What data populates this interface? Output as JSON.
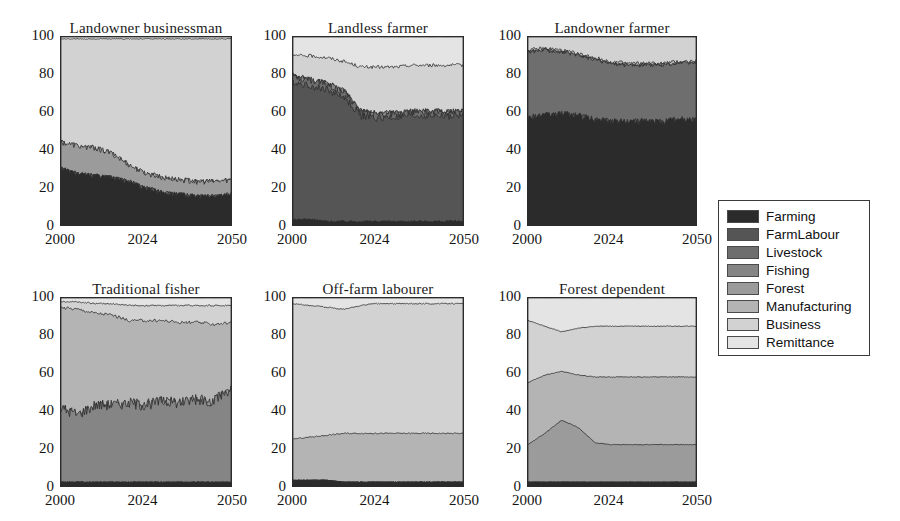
{
  "figure": {
    "width": 900,
    "height": 521,
    "background": "#ffffff"
  },
  "legend": {
    "position": "right",
    "entries": [
      {
        "label": "Farming",
        "color": "#2b2b2b"
      },
      {
        "label": "FarmLabour",
        "color": "#555555"
      },
      {
        "label": "Livestock",
        "color": "#6e6e6e"
      },
      {
        "label": "Fishing",
        "color": "#858585"
      },
      {
        "label": "Forest",
        "color": "#9b9b9b"
      },
      {
        "label": "Manufacturing",
        "color": "#b4b4b4"
      },
      {
        "label": "Business",
        "color": "#d2d2d2"
      },
      {
        "label": "Remittance",
        "color": "#e4e4e4"
      }
    ]
  },
  "axes": {
    "ylabel": "",
    "xlabel": "",
    "yticks": [
      0,
      20,
      40,
      60,
      80,
      100
    ],
    "xticks": [
      2000,
      2024,
      2050
    ],
    "ylim": [
      0,
      100
    ],
    "xlim": [
      2000,
      2050
    ],
    "grid": false
  },
  "chart_data": {
    "type": "area",
    "title": "",
    "stacked": true,
    "normalized": true,
    "xlabel": "",
    "ylabel": "",
    "ylim": [
      0,
      100
    ],
    "xlim": [
      2000,
      2050
    ],
    "grid": false,
    "legend_position": "right",
    "series_names": [
      "Farming",
      "FarmLabour",
      "Livestock",
      "Fishing",
      "Forest",
      "Manufacturing",
      "Business",
      "Remittance"
    ],
    "series_colors": [
      "#2b2b2b",
      "#555555",
      "#6e6e6e",
      "#858585",
      "#9b9b9b",
      "#b4b4b4",
      "#d2d2d2",
      "#e4e4e4"
    ],
    "x": [
      2000,
      2005,
      2010,
      2015,
      2020,
      2024,
      2030,
      2035,
      2040,
      2045,
      2050
    ],
    "panels": [
      {
        "title": "Landowner businessman",
        "cumulative_boundaries": {
          "Farming": [
            30,
            27,
            26,
            25,
            23,
            20,
            17,
            16,
            15,
            15,
            16
          ],
          "FarmLabour": [
            30,
            27,
            26,
            25,
            23,
            20,
            17,
            16,
            15,
            15,
            16
          ],
          "Livestock": [
            30,
            27,
            26,
            25,
            23,
            20,
            17,
            16,
            15,
            15,
            16
          ],
          "Fishing": [
            30,
            27,
            26,
            25,
            23,
            20,
            17,
            16,
            15,
            15,
            16
          ],
          "Forest": [
            44,
            42,
            41,
            38,
            32,
            28,
            25,
            24,
            23,
            23,
            24
          ],
          "Manufacturing": [
            44,
            42,
            41,
            38,
            32,
            28,
            25,
            24,
            23,
            23,
            24
          ],
          "Business": [
            99,
            99,
            99,
            99,
            99,
            99,
            99,
            99,
            99,
            99,
            99
          ],
          "Remittance": [
            100,
            100,
            100,
            100,
            100,
            100,
            100,
            100,
            100,
            100,
            100
          ]
        }
      },
      {
        "title": "Landless farmer",
        "cumulative_boundaries": {
          "Farming": [
            3,
            3,
            2,
            2,
            2,
            2,
            2,
            2,
            2,
            2,
            2
          ],
          "FarmLabour": [
            76,
            74,
            72,
            68,
            58,
            57,
            57,
            58,
            58,
            58,
            58
          ],
          "Livestock": [
            79,
            77,
            75,
            71,
            60,
            59,
            59,
            60,
            60,
            60,
            60
          ],
          "Fishing": [
            79,
            77,
            75,
            71,
            60,
            59,
            59,
            60,
            60,
            60,
            60
          ],
          "Forest": [
            79,
            77,
            75,
            71,
            60,
            59,
            59,
            60,
            60,
            60,
            60
          ],
          "Manufacturing": [
            79,
            77,
            75,
            71,
            60,
            59,
            59,
            60,
            60,
            60,
            60
          ],
          "Business": [
            90,
            90,
            89,
            87,
            84,
            84,
            84,
            85,
            85,
            85,
            85
          ],
          "Remittance": [
            100,
            100,
            100,
            100,
            100,
            100,
            100,
            100,
            100,
            100,
            100
          ]
        }
      },
      {
        "title": "Landowner farmer",
        "cumulative_boundaries": {
          "Farming": [
            57,
            58,
            59,
            58,
            56,
            55,
            55,
            55,
            55,
            56,
            56
          ],
          "FarmLabour": [
            57,
            58,
            59,
            58,
            56,
            55,
            55,
            55,
            55,
            56,
            56
          ],
          "Livestock": [
            92,
            93,
            92,
            90,
            88,
            86,
            85,
            85,
            85,
            86,
            86
          ],
          "Fishing": [
            92,
            93,
            92,
            90,
            88,
            86,
            85,
            85,
            85,
            86,
            86
          ],
          "Forest": [
            92,
            93,
            92,
            90,
            88,
            86,
            85,
            85,
            85,
            86,
            86
          ],
          "Manufacturing": [
            93,
            94,
            93,
            91,
            89,
            87,
            86,
            86,
            86,
            87,
            87
          ],
          "Business": [
            100,
            100,
            100,
            100,
            100,
            100,
            100,
            100,
            100,
            100,
            100
          ],
          "Remittance": [
            100,
            100,
            100,
            100,
            100,
            100,
            100,
            100,
            100,
            100,
            100
          ]
        }
      },
      {
        "title": "Traditional fisher",
        "cumulative_boundaries": {
          "Farming": [
            2,
            2,
            2,
            2,
            2,
            2,
            2,
            2,
            2,
            2,
            2
          ],
          "FarmLabour": [
            2,
            2,
            2,
            2,
            2,
            2,
            2,
            2,
            2,
            2,
            2
          ],
          "Livestock": [
            2,
            2,
            2,
            2,
            2,
            2,
            2,
            2,
            2,
            2,
            2
          ],
          "Fishing": [
            41,
            38,
            43,
            43,
            44,
            43,
            45,
            44,
            46,
            45,
            52
          ],
          "Forest": [
            41,
            38,
            43,
            43,
            44,
            43,
            45,
            44,
            46,
            45,
            52
          ],
          "Manufacturing": [
            95,
            94,
            92,
            91,
            88,
            88,
            88,
            87,
            87,
            86,
            87
          ],
          "Business": [
            98,
            98,
            97,
            97,
            96,
            96,
            96,
            96,
            96,
            96,
            96
          ],
          "Remittance": [
            100,
            100,
            100,
            100,
            100,
            100,
            100,
            100,
            100,
            100,
            100
          ]
        }
      },
      {
        "title": "Off-farm labourer",
        "cumulative_boundaries": {
          "Farming": [
            3,
            3,
            3,
            2,
            2,
            2,
            2,
            2,
            2,
            2,
            2
          ],
          "FarmLabour": [
            3,
            3,
            3,
            2,
            2,
            2,
            2,
            2,
            2,
            2,
            2
          ],
          "Livestock": [
            3,
            3,
            3,
            2,
            2,
            2,
            2,
            2,
            2,
            2,
            2
          ],
          "Fishing": [
            3,
            3,
            3,
            2,
            2,
            2,
            2,
            2,
            2,
            2,
            2
          ],
          "Forest": [
            3,
            3,
            3,
            2,
            2,
            2,
            2,
            2,
            2,
            2,
            2
          ],
          "Manufacturing": [
            25,
            26,
            27,
            28,
            28,
            28,
            28,
            28,
            28,
            28,
            28
          ],
          "Business": [
            97,
            96,
            95,
            94,
            96,
            97,
            97,
            97,
            97,
            97,
            97
          ],
          "Remittance": [
            100,
            100,
            100,
            100,
            100,
            100,
            100,
            100,
            100,
            100,
            100
          ]
        }
      },
      {
        "title": "Forest dependent",
        "cumulative_boundaries": {
          "Farming": [
            2,
            2,
            2,
            2,
            2,
            2,
            2,
            2,
            2,
            2,
            2
          ],
          "FarmLabour": [
            2,
            2,
            2,
            2,
            2,
            2,
            2,
            2,
            2,
            2,
            2
          ],
          "Livestock": [
            2,
            2,
            2,
            2,
            2,
            2,
            2,
            2,
            2,
            2,
            2
          ],
          "Fishing": [
            2,
            2,
            2,
            2,
            2,
            2,
            2,
            2,
            2,
            2,
            2
          ],
          "Forest": [
            22,
            28,
            35,
            31,
            23,
            22,
            22,
            22,
            22,
            22,
            22
          ],
          "Manufacturing": [
            55,
            59,
            61,
            59,
            58,
            58,
            58,
            58,
            58,
            58,
            58
          ],
          "Business": [
            88,
            85,
            82,
            84,
            85,
            85,
            85,
            85,
            85,
            85,
            85
          ],
          "Remittance": [
            100,
            100,
            100,
            100,
            100,
            100,
            100,
            100,
            100,
            100,
            100
          ]
        }
      }
    ]
  },
  "layout": {
    "panels": [
      {
        "box_x": 60,
        "box_y": 36,
        "box_w": 172,
        "box_h": 190,
        "title_x": 35,
        "title_y": 20
      },
      {
        "box_x": 292,
        "box_y": 36,
        "box_w": 172,
        "box_h": 190,
        "title_x": 267,
        "title_y": 20
      },
      {
        "box_x": 527,
        "box_y": 36,
        "box_w": 170,
        "box_h": 190,
        "title_x": 502,
        "title_y": 20
      },
      {
        "box_x": 60,
        "box_y": 297,
        "box_w": 172,
        "box_h": 190,
        "title_x": 35,
        "title_y": 281
      },
      {
        "box_x": 292,
        "box_y": 297,
        "box_w": 172,
        "box_h": 190,
        "title_x": 267,
        "title_y": 281
      },
      {
        "box_x": 527,
        "box_y": 297,
        "box_w": 170,
        "box_h": 190,
        "title_x": 502,
        "title_y": 281
      }
    ],
    "legend_box": {
      "x": 718,
      "y": 200,
      "w": 152,
      "h": 156
    }
  }
}
